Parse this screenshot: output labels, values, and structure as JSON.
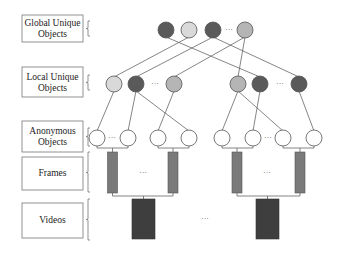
{
  "diagram": {
    "type": "hierarchy",
    "levels": [
      {
        "id": "global",
        "label_lines": [
          "Global Unique",
          "Objects"
        ]
      },
      {
        "id": "local",
        "label_lines": [
          "Local Unique",
          "Objects"
        ]
      },
      {
        "id": "anonymous",
        "label_lines": [
          "Anonymous",
          "Objects"
        ]
      },
      {
        "id": "frames",
        "label_lines": [
          "Frames"
        ]
      },
      {
        "id": "videos",
        "label_lines": [
          "Videos"
        ]
      }
    ],
    "ellipsis": "···",
    "colors": {
      "dark": "#5a5a5a",
      "light": "#d9d9d9",
      "mid": "#b5b5b5",
      "white": "#ffffff",
      "frame": "#7a7a7a",
      "video": "#3e3e3e",
      "stroke": "#666666"
    },
    "global_nodes": [
      "dark",
      "light",
      "dark",
      "mid"
    ],
    "local_nodes": [
      "light",
      "dark",
      "mid",
      "mid",
      "dark",
      "dark"
    ],
    "anonymous_nodes": 8,
    "frames": 4,
    "videos": 2,
    "global_to_local_edges": [
      [
        0,
        4
      ],
      [
        1,
        0
      ],
      [
        2,
        1
      ],
      [
        2,
        5
      ],
      [
        3,
        2
      ],
      [
        3,
        3
      ]
    ],
    "local_to_anonymous_edges": [
      [
        0,
        0
      ],
      [
        1,
        1
      ],
      [
        1,
        3
      ],
      [
        2,
        2
      ],
      [
        3,
        4
      ],
      [
        3,
        6
      ],
      [
        4,
        5
      ],
      [
        5,
        7
      ]
    ]
  }
}
